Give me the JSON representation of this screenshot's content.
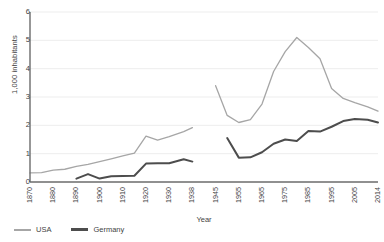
{
  "chart_data": {
    "type": "line",
    "title": "",
    "xlabel": "Year",
    "ylabel": "1,000 inhabitants",
    "ylim": [
      0,
      6
    ],
    "yticks": [
      0,
      1,
      2,
      3,
      4,
      5,
      6
    ],
    "xticks": [
      "1870",
      "1880",
      "1890",
      "1900",
      "1910",
      "1920",
      "1930",
      "1938",
      "1945",
      "1955",
      "1965",
      "1975",
      "1985",
      "1995",
      "2005",
      "2014"
    ],
    "grid": "horizontal",
    "legend_position": "bottom-left",
    "series": [
      {
        "name": "USA",
        "color": "#a6a6a6",
        "segments": [
          {
            "x": [
              "1870",
              "1875",
              "1880",
              "1885",
              "1890",
              "1895",
              "1900",
              "1905",
              "1910",
              "1915",
              "1920",
              "1925",
              "1930",
              "1935",
              "1938"
            ],
            "y": [
              0.32,
              0.33,
              0.42,
              0.45,
              0.55,
              0.62,
              0.72,
              0.82,
              0.92,
              1.02,
              1.62,
              1.48,
              1.6,
              1.78,
              1.92
            ]
          },
          {
            "x": [
              "1945",
              "1950",
              "1955",
              "1960",
              "1965",
              "1970",
              "1975",
              "1980",
              "1985",
              "1990",
              "1995",
              "2000",
              "2005",
              "2010",
              "2014"
            ],
            "y": [
              3.4,
              2.35,
              2.1,
              2.2,
              2.75,
              3.9,
              4.6,
              5.1,
              4.75,
              4.35,
              3.3,
              2.95,
              2.8,
              2.65,
              2.5
            ]
          }
        ]
      },
      {
        "name": "Germany",
        "color": "#4d4d4d",
        "segments": [
          {
            "x": [
              "1890",
              "1895",
              "1900",
              "1905",
              "1910",
              "1915",
              "1920",
              "1925",
              "1930",
              "1935",
              "1938"
            ],
            "y": [
              0.12,
              0.28,
              0.12,
              0.2,
              0.21,
              0.22,
              0.65,
              0.66,
              0.66,
              0.8,
              0.72
            ]
          },
          {
            "x": [
              "1950",
              "1955",
              "1960",
              "1965",
              "1970",
              "1975",
              "1980",
              "1985",
              "1990",
              "1995",
              "2000",
              "2005",
              "2010",
              "2014"
            ],
            "y": [
              1.55,
              0.86,
              0.87,
              1.05,
              1.35,
              1.5,
              1.45,
              1.8,
              1.78,
              1.95,
              2.15,
              2.22,
              2.2,
              2.1
            ]
          }
        ]
      }
    ]
  },
  "legend": {
    "items": [
      {
        "label": "USA",
        "color": "#a6a6a6"
      },
      {
        "label": "Germany",
        "color": "#4d4d4d"
      }
    ]
  }
}
